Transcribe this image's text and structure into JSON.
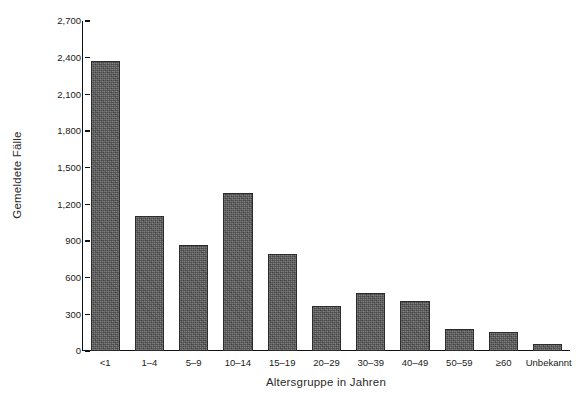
{
  "chart_data": {
    "type": "bar",
    "title": "",
    "xlabel": "Altersgruppe in Jahren",
    "ylabel": "Gemeldete Fälle",
    "categories": [
      "<1",
      "1–4",
      "5–9",
      "10–14",
      "15–19",
      "20–29",
      "30–39",
      "40–49",
      "50–59",
      "≥60",
      "Unbekannt"
    ],
    "values": [
      2370,
      1105,
      870,
      1295,
      790,
      365,
      475,
      410,
      180,
      155,
      55
    ],
    "ylim": [
      0,
      2700
    ],
    "ytick_values": [
      0,
      300,
      600,
      900,
      1200,
      1500,
      1800,
      2100,
      2400,
      2700
    ],
    "ytick_labels": [
      "0",
      "300",
      "600",
      "900",
      "1,200",
      "1,500",
      "1,800",
      "2,100",
      "2,400",
      "2,700"
    ],
    "grid": false,
    "legend": null,
    "bar_color": "#585858",
    "bar_edge_color": "#2c2c2c",
    "axis_color": "#111111",
    "background": "#ffffff"
  }
}
